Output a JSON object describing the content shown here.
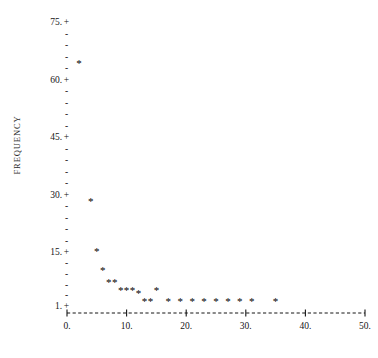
{
  "chart_data": {
    "type": "scatter",
    "title": "",
    "subtitle": "",
    "xlabel": "",
    "ylabel": "FREQUENCY",
    "xlim": [
      0,
      50
    ],
    "ylim": [
      1,
      75
    ],
    "grid": false,
    "legend": false,
    "legend_position": "none",
    "marker": "*",
    "style": "line-printer ASCII scatter plot",
    "x_ticks": [
      0,
      10,
      20,
      30,
      40,
      50
    ],
    "x_tick_labels": [
      "0.",
      "10.",
      "20.",
      "30.",
      "40.",
      "50."
    ],
    "y_ticks": [
      1,
      15,
      30,
      45,
      60,
      75
    ],
    "y_tick_labels": [
      "1.",
      "15.",
      "30.",
      "45.",
      "60.",
      "75."
    ],
    "y_minor_ticks_between": 4,
    "x": [
      2,
      4,
      5,
      6,
      7,
      8,
      9,
      10,
      11,
      12,
      13,
      14,
      15,
      17,
      19,
      21,
      23,
      25,
      27,
      29,
      31,
      35
    ],
    "y": [
      64,
      28,
      15,
      10,
      7,
      7,
      5,
      5,
      5,
      4,
      2,
      2,
      5,
      2,
      2,
      2,
      2,
      2,
      2,
      2,
      2,
      2
    ],
    "points": [
      {
        "x": 2,
        "y": 64
      },
      {
        "x": 4,
        "y": 28
      },
      {
        "x": 5,
        "y": 15
      },
      {
        "x": 6,
        "y": 10
      },
      {
        "x": 7,
        "y": 7
      },
      {
        "x": 8,
        "y": 7
      },
      {
        "x": 9,
        "y": 5
      },
      {
        "x": 10,
        "y": 5
      },
      {
        "x": 11,
        "y": 5
      },
      {
        "x": 12,
        "y": 4
      },
      {
        "x": 13,
        "y": 2
      },
      {
        "x": 14,
        "y": 2
      },
      {
        "x": 15,
        "y": 5
      },
      {
        "x": 17,
        "y": 2
      },
      {
        "x": 19,
        "y": 2
      },
      {
        "x": 21,
        "y": 2
      },
      {
        "x": 23,
        "y": 2
      },
      {
        "x": 25,
        "y": 2
      },
      {
        "x": 27,
        "y": 2
      },
      {
        "x": 29,
        "y": 2
      },
      {
        "x": 31,
        "y": 2
      },
      {
        "x": 35,
        "y": 2
      }
    ]
  },
  "axis": {
    "y_label": "FREQUENCY",
    "y_ticks": [
      {
        "label": "75.",
        "value": 75,
        "major": true
      },
      {
        "label": "",
        "value": 72,
        "major": false
      },
      {
        "label": "",
        "value": 69,
        "major": false
      },
      {
        "label": "",
        "value": 66,
        "major": false
      },
      {
        "label": "",
        "value": 63,
        "major": false
      },
      {
        "label": "60.",
        "value": 60,
        "major": true
      },
      {
        "label": "",
        "value": 57,
        "major": false
      },
      {
        "label": "",
        "value": 54,
        "major": false
      },
      {
        "label": "",
        "value": 51,
        "major": false
      },
      {
        "label": "",
        "value": 48,
        "major": false
      },
      {
        "label": "45.",
        "value": 45,
        "major": true
      },
      {
        "label": "",
        "value": 42,
        "major": false
      },
      {
        "label": "",
        "value": 39,
        "major": false
      },
      {
        "label": "",
        "value": 36,
        "major": false
      },
      {
        "label": "",
        "value": 33,
        "major": false
      },
      {
        "label": "30.",
        "value": 30,
        "major": true
      },
      {
        "label": "",
        "value": 27,
        "major": false
      },
      {
        "label": "",
        "value": 24,
        "major": false
      },
      {
        "label": "",
        "value": 21,
        "major": false
      },
      {
        "label": "",
        "value": 18,
        "major": false
      },
      {
        "label": "15.",
        "value": 15,
        "major": true
      },
      {
        "label": "",
        "value": 12.2,
        "major": false
      },
      {
        "label": "",
        "value": 9.4,
        "major": false
      },
      {
        "label": "",
        "value": 6.6,
        "major": false
      },
      {
        "label": "",
        "value": 3.8,
        "major": false
      },
      {
        "label": "1.",
        "value": 1,
        "major": true
      }
    ],
    "major_mark": "+",
    "minor_mark": "-",
    "x_axis_line": "+-------------+-------------+-------------+-------------+-------------+",
    "x_ticks": [
      {
        "label": "0.",
        "value": 0
      },
      {
        "label": "10.",
        "value": 10
      },
      {
        "label": "20.",
        "value": 20
      },
      {
        "label": "30.",
        "value": 30
      },
      {
        "label": "40.",
        "value": 40
      },
      {
        "label": "50.",
        "value": 50
      }
    ]
  },
  "colors": {
    "background": "#ffffff",
    "ink": "#151515",
    "point": "#000000"
  }
}
